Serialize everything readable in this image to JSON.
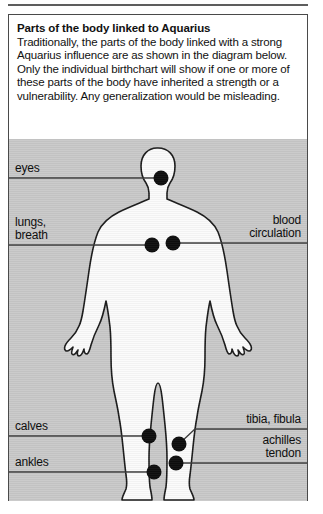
{
  "panel": {
    "intro": {
      "title": "Parts of the body linked to Aquarius",
      "body": "Traditionally, the parts of the body linked with a strong Aquarius influence are as shown in the diagram below. Only the individual birthchart will show if one or more of these parts of the body have inherited a strength or a vulnerability. Any generalization would be misleading."
    }
  },
  "diagram": {
    "labels": {
      "eyes": "eyes",
      "lungs_breath": "lungs,\nbreath",
      "blood_circulation": "blood\ncirculation",
      "calves": "calves",
      "ankles": "ankles",
      "tibia_fibula": "tibia, fibula",
      "achilles_tendon": "achilles\ntendon"
    }
  },
  "colors": {
    "page_background": "#ffffff",
    "panel_border": "#4a4a4a",
    "diagram_background": "#c9c9c9",
    "silhouette_fill": "#fbfbfb",
    "silhouette_outline": "#1a1a1a",
    "marker_dot": "#0d0d0d",
    "leader_line": "#3a3a3a",
    "text": "#111111"
  }
}
